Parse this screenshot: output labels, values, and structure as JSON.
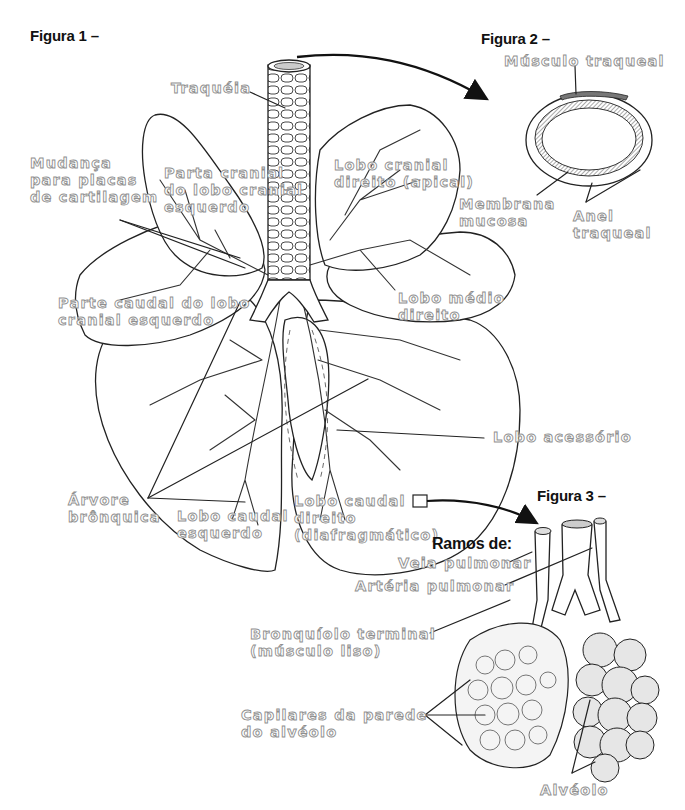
{
  "figures": {
    "fig1": {
      "title": "Figura 1 –"
    },
    "fig2": {
      "title": "Figura 2 –"
    },
    "fig3": {
      "title": "Figura 3 –"
    }
  },
  "fig1_labels": {
    "trachea": "Traquéia",
    "cartilage_change": "Mudança\npara placas\nde cartilagem",
    "left_cranial_cranial_part": "Parta cranial\ndo lobo cranial\nesquerdo",
    "right_cranial_lobe": "Lobo cranial\ndireito (apical)",
    "left_cranial_caudal_part": "Parte caudal do lobo\ncranial esquerdo",
    "right_middle_lobe": "Lobo médio\ndireito",
    "accessory_lobe": "Lobo acessório",
    "bronchial_tree": "Árvore\nbrônquica",
    "left_caudal_lobe": "Lobo caudal\nesquerdo",
    "right_caudal_lobe": "Lobo caudal\ndireito\n(diafragmático)"
  },
  "fig2_labels": {
    "tracheal_muscle": "Músculo traqueal",
    "mucous_membrane": "Membrana\nmucosa",
    "tracheal_ring": "Anel\ntraqueal"
  },
  "fig3_labels": {
    "branches_of": "Ramos de:",
    "pulmonary_vein": "Veia pulmonar",
    "pulmonary_artery": "Artéria pulmonar",
    "terminal_bronchiole": "Bronquíolo terminal\n(músculo liso)",
    "alveolar_capillaries": "Capilares da parede\ndo alvéolo",
    "alveolus": "Alvéolo"
  },
  "colors": {
    "label_fill": "#ffffff",
    "label_stroke": "#8f8f8f",
    "line_art": "#222222",
    "title_text": "#111111"
  }
}
